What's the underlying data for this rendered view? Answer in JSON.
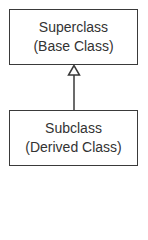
{
  "diagram": {
    "type": "uml-inheritance",
    "superclass": {
      "line1": "Superclass",
      "line2": "(Base Class)"
    },
    "subclass": {
      "line1": "Subclass",
      "line2": "(Derived Class)"
    },
    "relationship": "generalization",
    "colors": {
      "stroke": "#3a3a3a",
      "text": "#333333",
      "background": "#ffffff"
    }
  }
}
